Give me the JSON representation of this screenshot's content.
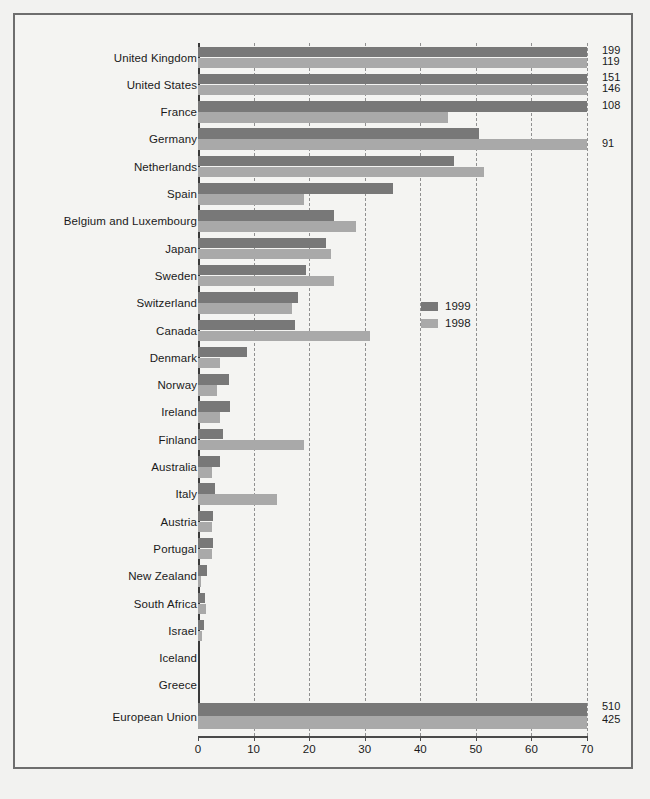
{
  "chart_data": {
    "type": "bar",
    "orientation": "horizontal",
    "title": "",
    "xlabel": "",
    "ylabel": "",
    "xlim": [
      0,
      70
    ],
    "xticks": [
      "0",
      "10",
      "20",
      "30",
      "40",
      "50",
      "60",
      "70"
    ],
    "grid": true,
    "legend_position": "middle-right-inside",
    "legend": [
      "1999",
      "1998"
    ],
    "series": [
      {
        "name": "1999",
        "color": "#787878"
      },
      {
        "name": "1998",
        "color": "#a9a9a9"
      }
    ],
    "categories": [
      "United Kingdom",
      "United States",
      "France",
      "Germany",
      "Netherlands",
      "Spain",
      "Belgium and Luxembourg",
      "Japan",
      "Sweden",
      "Switzerland",
      "Canada",
      "Denmark",
      "Norway",
      "Ireland",
      "Finland",
      "Australia",
      "Italy",
      "Austria",
      "Portugal",
      "New Zealand",
      "South Africa",
      "Israel",
      "Iceland",
      "Greece"
    ],
    "values_1999": [
      199,
      151,
      108,
      50.5,
      46,
      35,
      24.5,
      23,
      19.5,
      18,
      17.5,
      8.8,
      5.5,
      5.8,
      4.5,
      4,
      3,
      2.7,
      2.7,
      1.6,
      1.2,
      1.0,
      0,
      0
    ],
    "values_1998": [
      119,
      146,
      45,
      91,
      51.5,
      19,
      28.5,
      24,
      24.5,
      17,
      31,
      4,
      3.5,
      4,
      19,
      2.5,
      14.3,
      2.5,
      2.5,
      0.6,
      1.4,
      0.8,
      0,
      0
    ],
    "data_labels_1999": [
      "199",
      "151",
      "108",
      "",
      "",
      "",
      "",
      "",
      "",
      "",
      "",
      "",
      "",
      "",
      "",
      "",
      "",
      "",
      "",
      "",
      "",
      "",
      "",
      ""
    ],
    "data_labels_1998": [
      "119",
      "146",
      "",
      "91",
      "",
      "",
      "",
      "",
      "",
      "",
      "",
      "",
      "",
      "",
      "",
      "",
      "",
      "",
      "",
      "",
      "",
      "",
      "",
      ""
    ],
    "total_row": {
      "category": "European Union",
      "value_1999": 510,
      "value_1998": 425,
      "label_1999": "510",
      "label_1998": "425"
    }
  }
}
